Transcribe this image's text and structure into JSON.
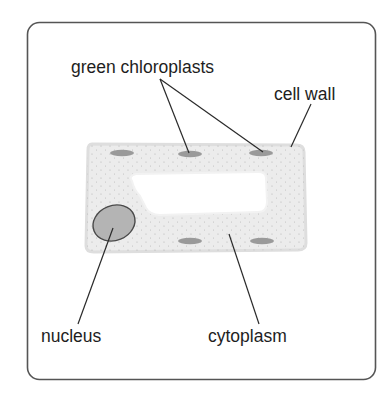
{
  "diagram": {
    "labels": {
      "chloroplasts": "green chloroplasts",
      "cell_wall": "cell wall",
      "nucleus": "nucleus",
      "cytoplasm": "cytoplasm"
    },
    "colors": {
      "frame": "#555555",
      "cell_fill": "#ececec",
      "cell_edge": "#dcdcdc",
      "vacuole": "#ffffff",
      "chloroplast": "#9a9a9a",
      "nucleus_fill": "#b4b4b4",
      "nucleus_edge": "#4a4a4a",
      "text": "#1e1e1e"
    }
  }
}
